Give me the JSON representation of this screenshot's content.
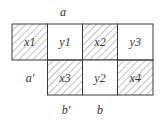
{
  "diagram": {
    "colors": {
      "border": "#3a3a3a",
      "hatch": "#8a8a8a",
      "background": "#ffffff"
    },
    "labels": {
      "top": "a",
      "left_row2": "a′",
      "bottom_col1": "b′",
      "bottom_col2": "b"
    },
    "row1": [
      {
        "label": "x1",
        "hatched": true
      },
      {
        "label": "y1",
        "hatched": false
      },
      {
        "label": "x2",
        "hatched": true
      },
      {
        "label": "y3",
        "hatched": false
      }
    ],
    "row2": [
      {
        "label": "x3",
        "hatched": true
      },
      {
        "label": "y2",
        "hatched": false
      },
      {
        "label": "x4",
        "hatched": true
      }
    ]
  }
}
